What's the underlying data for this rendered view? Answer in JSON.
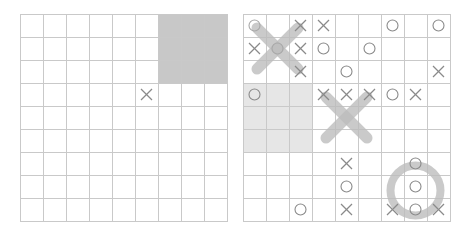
{
  "boards": [
    {
      "id": "left",
      "shade_color": "#c8c8c8",
      "shaded_subboards": [
        [
          0,
          2
        ]
      ],
      "marks": [
        {
          "row": 3,
          "col": 5,
          "type": "X"
        }
      ],
      "big_marks": []
    },
    {
      "id": "right",
      "shade_color": "#e6e6e6",
      "shaded_subboards": [
        [
          1,
          0
        ]
      ],
      "marks": [
        {
          "row": 0,
          "col": 0,
          "type": "O",
          "faded": true
        },
        {
          "row": 0,
          "col": 2,
          "type": "X"
        },
        {
          "row": 0,
          "col": 3,
          "type": "X"
        },
        {
          "row": 0,
          "col": 6,
          "type": "O"
        },
        {
          "row": 0,
          "col": 8,
          "type": "O"
        },
        {
          "row": 1,
          "col": 0,
          "type": "X"
        },
        {
          "row": 1,
          "col": 1,
          "type": "O",
          "faded": true
        },
        {
          "row": 1,
          "col": 2,
          "type": "X"
        },
        {
          "row": 1,
          "col": 3,
          "type": "O"
        },
        {
          "row": 1,
          "col": 5,
          "type": "O"
        },
        {
          "row": 2,
          "col": 2,
          "type": "X"
        },
        {
          "row": 2,
          "col": 4,
          "type": "O"
        },
        {
          "row": 2,
          "col": 8,
          "type": "X"
        },
        {
          "row": 3,
          "col": 0,
          "type": "O"
        },
        {
          "row": 3,
          "col": 3,
          "type": "X"
        },
        {
          "row": 3,
          "col": 4,
          "type": "X"
        },
        {
          "row": 3,
          "col": 5,
          "type": "X"
        },
        {
          "row": 3,
          "col": 6,
          "type": "O"
        },
        {
          "row": 3,
          "col": 7,
          "type": "X"
        },
        {
          "row": 6,
          "col": 4,
          "type": "X"
        },
        {
          "row": 6,
          "col": 7,
          "type": "O"
        },
        {
          "row": 7,
          "col": 4,
          "type": "O"
        },
        {
          "row": 7,
          "col": 7,
          "type": "O"
        },
        {
          "row": 8,
          "col": 2,
          "type": "O"
        },
        {
          "row": 8,
          "col": 4,
          "type": "X"
        },
        {
          "row": 8,
          "col": 6,
          "type": "X"
        },
        {
          "row": 8,
          "col": 7,
          "type": "O"
        },
        {
          "row": 8,
          "col": 8,
          "type": "X"
        }
      ],
      "big_marks": [
        {
          "sub_row": 0,
          "sub_col": 0,
          "type": "X"
        },
        {
          "sub_row": 1,
          "sub_col": 1,
          "type": "X"
        },
        {
          "sub_row": 2,
          "sub_col": 2,
          "type": "O"
        }
      ]
    }
  ],
  "colors": {
    "grid_line": "#c9c9c9",
    "mark": "#8a8a8a",
    "big_mark": "#bdbdbd"
  }
}
